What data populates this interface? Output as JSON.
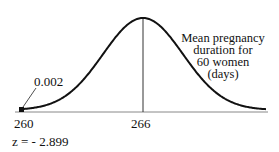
{
  "chart_data": {
    "type": "line",
    "title": "",
    "curve_label": "Mean pregnancy duration for 60 women (days)",
    "curve_label_lines": [
      "Mean pregnancy",
      "duration for",
      "60 women",
      "(days)"
    ],
    "center": 266,
    "marked_value": 260,
    "tail_area": "0.002",
    "z_label": "z = - 2.899",
    "xticks": [
      "260",
      "266"
    ],
    "xlabel": "",
    "ylabel": "",
    "grid": false,
    "legend": "none"
  },
  "colors": {
    "curve": "#111111",
    "axis": "#777777",
    "text": "#111111"
  }
}
